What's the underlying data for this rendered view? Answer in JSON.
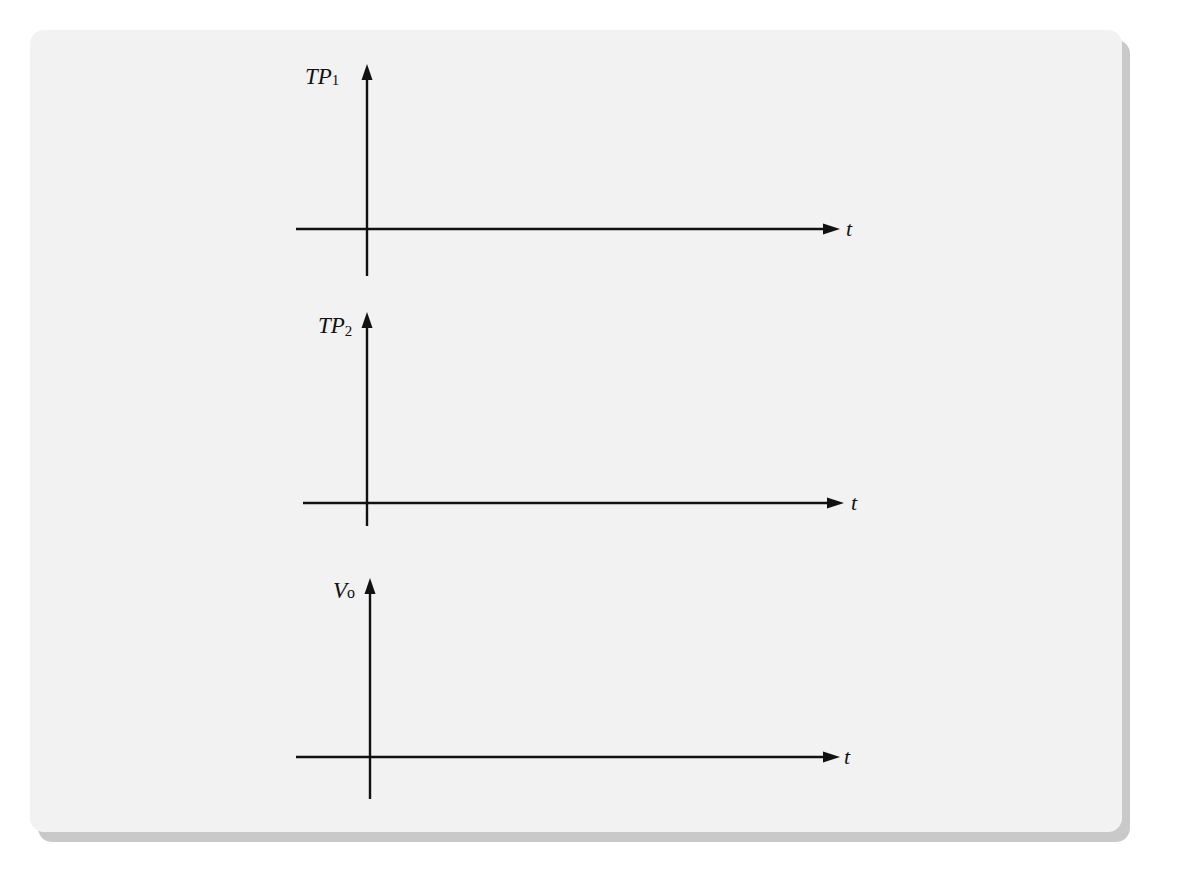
{
  "figure": {
    "graphs": [
      {
        "id": "tp1",
        "y_label": "TP",
        "y_subscript": "1",
        "x_label": "t",
        "origin": [
          367,
          229
        ],
        "y_axis": {
          "top": 68,
          "bottom": 276
        },
        "x_axis": {
          "left": 296,
          "right": 838
        }
      },
      {
        "id": "tp2",
        "y_label": "TP",
        "y_subscript": "2",
        "x_label": "t",
        "origin": [
          367,
          503
        ],
        "y_axis": {
          "top": 314,
          "bottom": 526
        },
        "x_axis": {
          "left": 303,
          "right": 843
        }
      },
      {
        "id": "vo",
        "y_label": "V",
        "y_subscript": "o",
        "x_label": "t",
        "origin": [
          370,
          757
        ],
        "y_axis": {
          "top": 580,
          "bottom": 799
        },
        "x_axis": {
          "left": 296,
          "right": 838
        }
      }
    ],
    "colors": {
      "panel": "#f2f2f2",
      "shadow": "#c9c9c9",
      "ink": "#111111"
    }
  }
}
